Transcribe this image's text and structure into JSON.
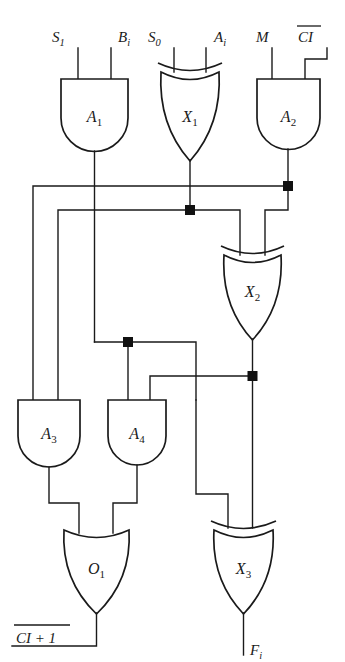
{
  "diagram": {
    "type": "logic-circuit",
    "colors": {
      "background": "#ffffff",
      "line": "#1a1a1a",
      "junction": "#111111"
    }
  },
  "inputs": [
    {
      "id": "S1",
      "base": "S",
      "sub": "1",
      "overline": false,
      "x": 68,
      "y": 38
    },
    {
      "id": "Bi",
      "base": "B",
      "sub": "i",
      "overline": false,
      "x": 108,
      "y": 38
    },
    {
      "id": "S0",
      "base": "S",
      "sub": "0",
      "overline": false,
      "x": 155,
      "y": 38
    },
    {
      "id": "Ai",
      "base": "A",
      "sub": "i",
      "overline": false,
      "x": 205,
      "y": 38
    },
    {
      "id": "M",
      "base": "M",
      "sub": "",
      "overline": false,
      "x": 263,
      "y": 38
    },
    {
      "id": "CI",
      "base": "CI",
      "sub": "",
      "overline": true,
      "x": 312,
      "y": 38
    }
  ],
  "outputs": [
    {
      "id": "CI+1",
      "base": "CI + 1",
      "sub": "",
      "overline": true,
      "x": 18,
      "y": 645
    },
    {
      "id": "Fi",
      "base": "F",
      "sub": "i",
      "overline": false,
      "x": 245,
      "y": 650
    }
  ],
  "gates": [
    {
      "id": "A1",
      "base": "A",
      "sub": "1",
      "kind": "and",
      "label": "A1"
    },
    {
      "id": "X1",
      "base": "X",
      "sub": "1",
      "kind": "xor",
      "label": "X1"
    },
    {
      "id": "A2",
      "base": "A",
      "sub": "2",
      "kind": "and",
      "label": "A2"
    },
    {
      "id": "X2",
      "base": "X",
      "sub": "2",
      "kind": "xor",
      "label": "X2"
    },
    {
      "id": "A3",
      "base": "A",
      "sub": "3",
      "kind": "and",
      "label": "A3"
    },
    {
      "id": "A4",
      "base": "A",
      "sub": "4",
      "kind": "and",
      "label": "A4"
    },
    {
      "id": "O1",
      "base": "O",
      "sub": "1",
      "kind": "or",
      "label": "O1"
    },
    {
      "id": "X3",
      "base": "X",
      "sub": "3",
      "kind": "xor",
      "label": "X3"
    }
  ],
  "junctions": [
    {
      "id": "j-a2-out",
      "x": 288,
      "y": 186
    },
    {
      "id": "j-x1-out",
      "x": 190,
      "y": 210
    },
    {
      "id": "j-a1-out",
      "x": 128,
      "y": 342
    },
    {
      "id": "j-x2-out",
      "x": 252,
      "y": 376
    }
  ],
  "nets": [
    {
      "from": "A1",
      "to": [
        "A3",
        "A4"
      ],
      "name": "a1-output-net"
    },
    {
      "from": "X1",
      "to": [
        "X2",
        "A3"
      ],
      "name": "x1-output-net"
    },
    {
      "from": "A2",
      "to": [
        "X2",
        "A3"
      ],
      "name": "a2-output-net"
    },
    {
      "from": "X2",
      "to": [
        "A4",
        "X3"
      ],
      "name": "x2-output-net"
    },
    {
      "from": "A3",
      "to": [
        "O1"
      ],
      "name": "a3-output-net"
    },
    {
      "from": "A4",
      "to": [
        "O1"
      ],
      "name": "a4-output-net"
    },
    {
      "from": "O1",
      "to": [
        "CI+1"
      ],
      "name": "o1-output-net"
    },
    {
      "from": "X3",
      "to": [
        "Fi"
      ],
      "name": "x3-output-net"
    }
  ]
}
